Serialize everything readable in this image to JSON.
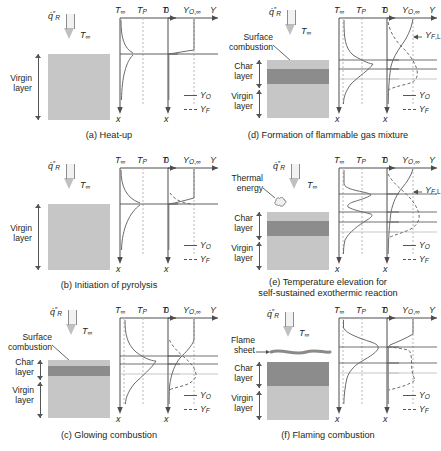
{
  "figure": {
    "panel_count": 6
  },
  "symbols": {
    "flux": "q̇″R",
    "t_inf": "T∞",
    "t_p": "TP",
    "t_axis": "T",
    "zero": "0",
    "y_o_inf": "YO,∞",
    "y_axis": "Y",
    "x_axis": "x",
    "y_o": "YO",
    "y_f": "YF",
    "y_fl": "YF,L"
  },
  "labels": {
    "virgin_layer": "Virgin\nlayer",
    "char_layer": "Char\nlayer",
    "surface_combustion": "Surface\ncombustion",
    "thermal_energy": "Thermal\nenergy",
    "flame_sheet": "Flame\nsheet"
  },
  "colors": {
    "virgin": "#c6c6c6",
    "char": "#8c8c8c",
    "axis": "#4d4d4d",
    "curve": "#6b6b6b",
    "gridline": "#b9b9b9",
    "text": "#231f20"
  },
  "panels": [
    {
      "id": "a",
      "caption": "(a) Heat-up",
      "has_char_layer": false,
      "annotations": [
        "virgin_layer"
      ],
      "temperature_note": "Steep rise at surface, T∞ in gas, decaying into solid",
      "species_note": "YO constant at YO,∞ in gas, drops to ~0 in solid; YF ~ 0"
    },
    {
      "id": "b",
      "caption": "(b) Initiation of pyrolysis",
      "has_char_layer": false,
      "annotations": [
        "virgin_layer"
      ],
      "temperature_note": "Surface reaches pyrolysis temperature TP",
      "species_note": "Small YF appears near surface; YO slightly depleted"
    },
    {
      "id": "c",
      "caption": "(c) Glowing combustion",
      "has_char_layer": true,
      "annotations": [
        "surface_combustion",
        "char_layer",
        "virgin_layer"
      ],
      "temperature_note": "Peak T at char surface due to surface oxidation",
      "species_note": "YO consumed at surface; YF rises within char"
    },
    {
      "id": "d",
      "caption": "(d) Formation of flammable gas mixture",
      "has_char_layer": true,
      "annotations": [
        "surface_combustion",
        "char_layer",
        "virgin_layer",
        "y_fl"
      ],
      "temperature_note": "Temperature peak above char surface",
      "species_note": "YF exceeds lower flammability limit YF,L in gas phase"
    },
    {
      "id": "e",
      "caption": "(e) Temperature elevation for\nself-sustained exothermic reaction",
      "caption_lines": [
        "(e) Temperature elevation for",
        "self-sustained exothermic reaction"
      ],
      "has_char_layer": true,
      "annotations": [
        "thermal_energy",
        "char_layer",
        "virgin_layer",
        "y_fl"
      ],
      "temperature_note": "Secondary temperature peak in gas from exothermic reaction",
      "species_note": "YF and YO cross near YF,L; reaction zone forming"
    },
    {
      "id": "f",
      "caption": "(f) Flaming combustion",
      "has_char_layer": true,
      "annotations": [
        "flame_sheet",
        "char_layer",
        "virgin_layer"
      ],
      "temperature_note": "Sharp temperature peak at flame sheet above surface",
      "species_note": "YO drops to 0 at flame sheet where YF is consumed"
    }
  ]
}
